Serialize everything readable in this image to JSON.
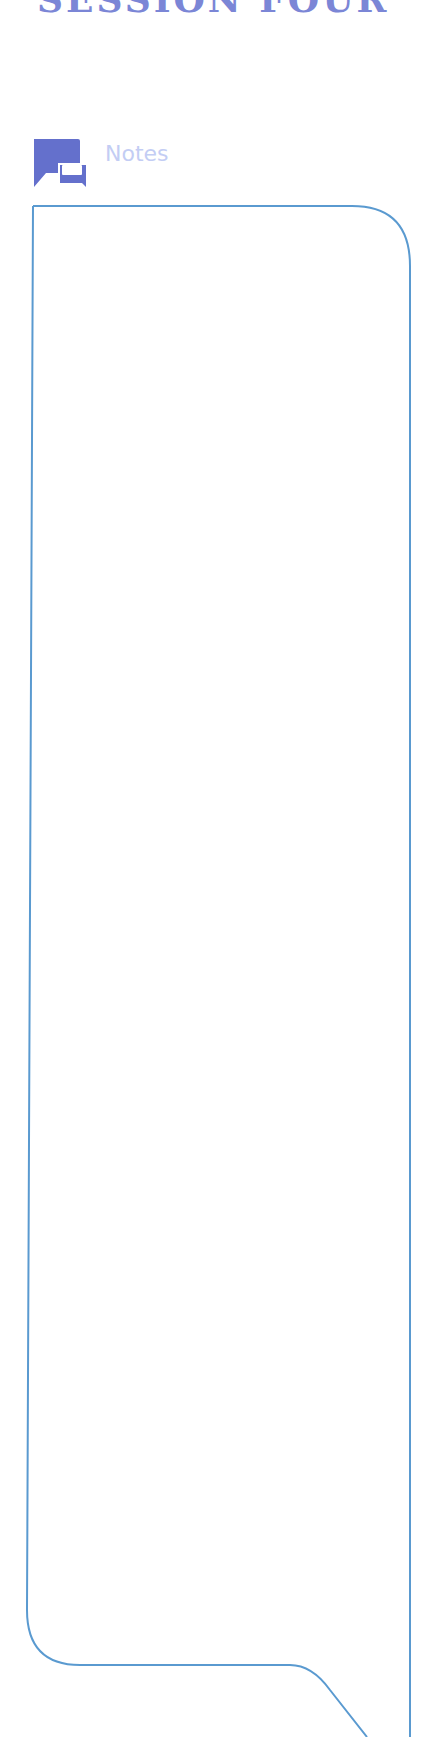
{
  "header": {
    "title": "SESSION FOUR"
  },
  "notes": {
    "label": "Notes",
    "icon": "chat-bubbles-icon",
    "content": ""
  },
  "colors": {
    "title": "#7b86d6",
    "icon": "#6470cc",
    "label": "#c3cdf4",
    "box_border": "#5a9ad0"
  }
}
